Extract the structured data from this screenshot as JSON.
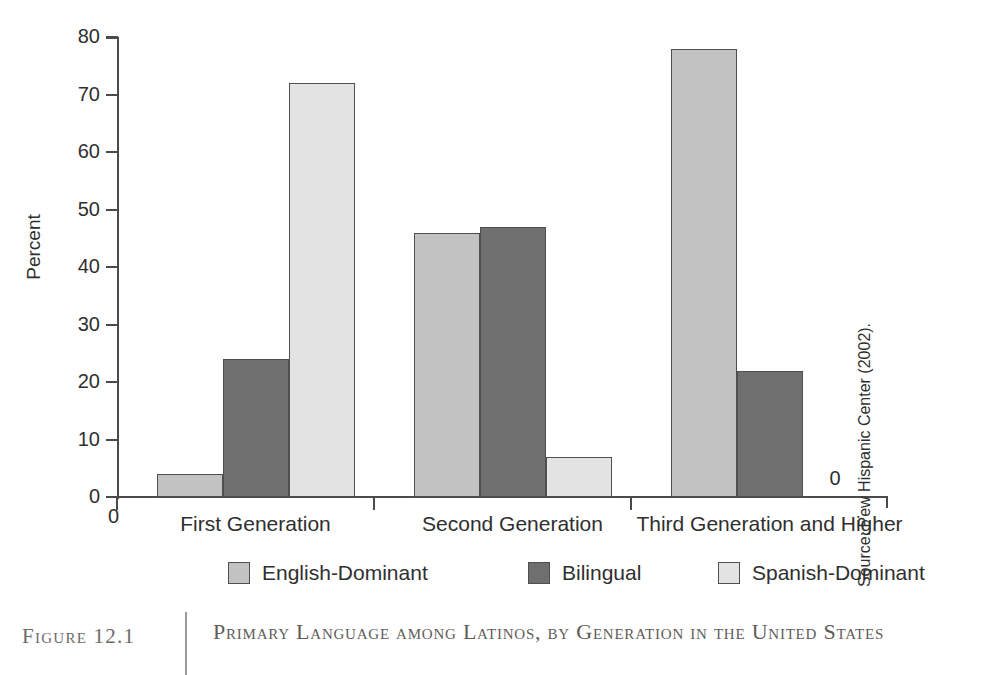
{
  "chart_data": {
    "type": "bar",
    "title": "Primary Language among Latinos, by Generation in the United States",
    "xlabel": "",
    "ylabel": "Percent",
    "ylim": [
      0,
      80
    ],
    "yticks": [
      0,
      10,
      20,
      30,
      40,
      50,
      60,
      70,
      80
    ],
    "grid": false,
    "legend_position": "bottom",
    "categories": [
      "First Generation",
      "Second Generation",
      "Third Generation and Higher"
    ],
    "series": [
      {
        "name": "English-Dominant",
        "color": "#c2c2c2",
        "values": [
          4,
          46,
          78
        ]
      },
      {
        "name": "Bilingual",
        "color": "#6f6f6f",
        "values": [
          24,
          47,
          22
        ]
      },
      {
        "name": "Spanish-Dominant",
        "color": "#e3e3e3",
        "values": [
          72,
          7,
          0
        ]
      }
    ],
    "annotations": [
      {
        "text": "0",
        "series": "Spanish-Dominant",
        "category": "Third Generation and Higher"
      }
    ],
    "axis_origin_label": "0"
  },
  "axis": {
    "y_label": "Percent",
    "y_ticks": [
      "80",
      "70",
      "60",
      "50",
      "40",
      "30",
      "20",
      "10",
      "0"
    ],
    "x_origin": "0"
  },
  "legend": {
    "items": [
      {
        "label": "English-Dominant"
      },
      {
        "label": "Bilingual"
      },
      {
        "label": "Spanish-Dominant"
      }
    ]
  },
  "groups": [
    {
      "label": "First Generation"
    },
    {
      "label": "Second Generation"
    },
    {
      "label": "Third Generation and Higher"
    }
  ],
  "annotation": {
    "zero": "0"
  },
  "source": {
    "text": "Source: Pew Hispanic Center (2002)."
  },
  "caption": {
    "figure_number": "Figure 12.1",
    "title": "Primary Language among Latinos, by Generation in the United States"
  }
}
